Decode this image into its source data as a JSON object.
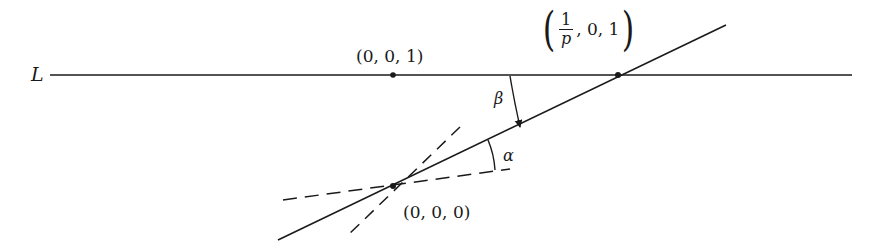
{
  "diagram": {
    "type": "geometric-construction",
    "line_label": "L",
    "points": {
      "p001": {
        "label": "(0, 0, 1)",
        "x": 393,
        "y": 75
      },
      "p1p01": {
        "label_numerator": "1",
        "label_denominator": "p",
        "label_rest": ", 0, 1",
        "x": 618,
        "y": 75
      },
      "origin": {
        "label": "(0, 0, 0)",
        "x": 393,
        "y": 186
      }
    },
    "angles": {
      "beta": "β",
      "alpha": "α"
    },
    "colors": {
      "stroke": "#1a1a1a",
      "background": "#ffffff"
    }
  }
}
